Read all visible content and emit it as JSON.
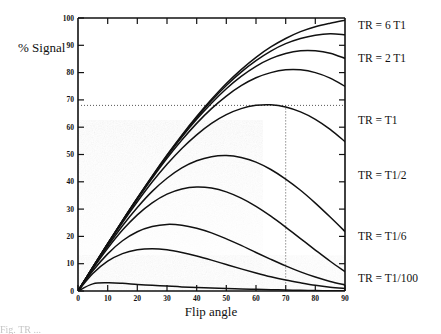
{
  "figure": {
    "kind": "scientific-plot",
    "background_color": "#ffffff",
    "ink_color": "#111111"
  },
  "axes": {
    "y_title": "% Signal",
    "x_title": "Flip angle",
    "x_ticks": [
      0,
      10,
      20,
      30,
      40,
      50,
      60,
      70,
      80,
      90
    ],
    "y_ticks": [
      0,
      10,
      20,
      30,
      40,
      50,
      60,
      70,
      80,
      90,
      100
    ],
    "x_min": 0,
    "x_max": 90,
    "y_min": 0,
    "y_max": 100
  },
  "reference_lines": {
    "horizontal_value": 68,
    "vertical_value": 70,
    "style": "dotted"
  },
  "series_labels": [
    {
      "text": "TR = 6 T1"
    },
    {
      "text": "TR = 2 T1"
    },
    {
      "text": "TR = T1"
    },
    {
      "text": "TR = T1/2"
    },
    {
      "text": "TR = T1/6"
    },
    {
      "text": "TR = T1/100"
    }
  ],
  "caption": "Fig. TR ...",
  "chart_data": {
    "type": "line",
    "title": "",
    "xlabel": "Flip angle",
    "ylabel": "% Signal",
    "xlim": [
      0,
      90
    ],
    "ylim": [
      0,
      100
    ],
    "grid": false,
    "legend_position": "right-inline",
    "x": [
      0,
      5,
      10,
      15,
      20,
      25,
      30,
      35,
      40,
      45,
      50,
      55,
      60,
      65,
      70,
      75,
      80,
      85,
      90
    ],
    "annotations": [
      {
        "type": "hline",
        "y": 68,
        "style": "dotted"
      },
      {
        "type": "vline",
        "x": 70,
        "style": "dotted"
      }
    ],
    "series": [
      {
        "name": "TR = 6 T1",
        "label": "TR = 6 T1",
        "tr_over_t1": 6,
        "values": [
          0,
          8.7,
          17.3,
          25.8,
          34.1,
          42.1,
          49.8,
          57.1,
          63.9,
          70.2,
          76.0,
          81.1,
          85.6,
          89.4,
          92.5,
          95.0,
          96.8,
          98.1,
          99.2
        ]
      },
      {
        "name": "TR = 4 T1",
        "label": "",
        "tr_over_t1": 4,
        "values": [
          0,
          8.7,
          17.3,
          25.8,
          34.0,
          42.0,
          49.6,
          56.8,
          63.5,
          69.7,
          75.3,
          80.2,
          84.4,
          87.9,
          90.6,
          92.5,
          93.7,
          94.2,
          93.9
        ]
      },
      {
        "name": "TR = 3 T1",
        "label": "",
        "tr_over_t1": 3,
        "values": [
          0,
          8.7,
          17.3,
          25.7,
          33.9,
          41.8,
          49.3,
          56.4,
          62.9,
          68.8,
          74.1,
          78.6,
          82.3,
          85.1,
          87.0,
          88.0,
          88.0,
          87.1,
          85.2
        ]
      },
      {
        "name": "TR = 2 T1",
        "label": "TR = 2 T1",
        "tr_over_t1": 2,
        "values": [
          0,
          8.7,
          17.2,
          25.6,
          33.6,
          41.3,
          48.6,
          55.3,
          61.4,
          66.8,
          71.4,
          75.2,
          78.1,
          80.0,
          81.0,
          81.0,
          80.0,
          78.0,
          75.0
        ]
      },
      {
        "name": "TR = T1",
        "label": "TR = T1",
        "tr_over_t1": 1,
        "values": [
          0,
          8.6,
          17.0,
          25.1,
          32.7,
          39.9,
          46.4,
          52.2,
          57.2,
          61.4,
          64.6,
          66.8,
          68.0,
          68.2,
          67.4,
          65.6,
          62.9,
          59.2,
          54.7
        ]
      },
      {
        "name": "TR = T1/2",
        "label": "TR = T1/2",
        "tr_over_t1": 0.5,
        "values": [
          0,
          8.4,
          16.4,
          23.9,
          30.6,
          36.5,
          41.3,
          45.1,
          47.7,
          49.2,
          49.6,
          48.9,
          47.2,
          44.5,
          41.0,
          36.9,
          32.2,
          27.1,
          21.8
        ]
      },
      {
        "name": "TR = T1/3",
        "label": "",
        "tr_over_t1": 0.3333,
        "values": [
          0,
          8.1,
          15.6,
          22.3,
          27.9,
          32.3,
          35.5,
          37.4,
          38.1,
          37.7,
          36.3,
          34.0,
          31.0,
          27.4,
          23.4,
          19.2,
          15.0,
          10.9,
          7.1
        ]
      },
      {
        "name": "TR = T1/6",
        "label": "TR = T1/6",
        "tr_over_t1": 0.1667,
        "values": [
          0,
          7.4,
          13.6,
          18.4,
          21.7,
          23.6,
          24.4,
          24.1,
          23.0,
          21.3,
          19.1,
          16.7,
          14.1,
          11.6,
          9.2,
          7.0,
          5.1,
          3.5,
          2.2
        ]
      },
      {
        "name": "TR = T1/12",
        "label": "",
        "tr_over_t1": 0.0833,
        "values": [
          0,
          6.4,
          10.9,
          13.7,
          15.1,
          15.5,
          15.1,
          14.1,
          12.8,
          11.3,
          9.7,
          8.1,
          6.6,
          5.2,
          4.0,
          3.0,
          2.1,
          1.4,
          0.9
        ]
      },
      {
        "name": "TR = T1/100",
        "label": "TR = T1/100",
        "tr_over_t1": 0.01,
        "values": [
          0,
          2.6,
          3.0,
          2.8,
          2.4,
          2.1,
          1.8,
          1.5,
          1.3,
          1.1,
          0.9,
          0.7,
          0.6,
          0.5,
          0.35,
          0.25,
          0.17,
          0.1,
          0.05
        ]
      }
    ]
  }
}
